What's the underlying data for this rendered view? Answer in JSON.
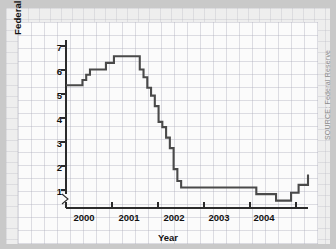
{
  "figure": {
    "source_note": "SOURCE: Federal Reserve",
    "background_color": "#c9c9c9",
    "panel_color": "#fbfbfb",
    "line_color": "#4a4a4a"
  },
  "chart_data": {
    "type": "line",
    "title": "",
    "xlabel": "Year",
    "ylabel": "Federal Funds Rate (%)",
    "xlim": [
      1999.45,
      2004.6
    ],
    "ylim": [
      0.72,
      7.35
    ],
    "grid": true,
    "legend": null,
    "y_axis_break": true,
    "line_style": "step-post",
    "xtick_labels": [
      "2000",
      "2001",
      "2002",
      "2003",
      "2004"
    ],
    "xtick_label_positions": [
      2000.0,
      2001.0,
      2002.0,
      2003.0,
      2004.0
    ],
    "xtick_mark_positions": [
      1999.5,
      2000.5,
      2001.5,
      2002.5,
      2003.5,
      2004.5
    ],
    "ytick_labels": [
      "1",
      "2",
      "3",
      "4",
      "5",
      "6",
      "7"
    ],
    "ytick_values": [
      1,
      2,
      3,
      4,
      5,
      6,
      7
    ],
    "x": [
      1999.45,
      1999.72,
      1999.8,
      1999.88,
      1999.96,
      2000.13,
      2000.3,
      2000.47,
      2000.96,
      2001.02,
      2001.1,
      2001.18,
      2001.26,
      2001.34,
      2001.42,
      2001.5,
      2001.58,
      2001.66,
      2001.74,
      2001.82,
      2001.9,
      2002.5,
      2003.5,
      2003.92,
      2004.08,
      2004.24,
      2004.4,
      2004.6
    ],
    "values": [
      5.4,
      5.4,
      5.6,
      5.8,
      6.0,
      6.0,
      6.25,
      6.5,
      6.5,
      6.0,
      5.7,
      5.3,
      5.0,
      4.6,
      4.0,
      3.8,
      3.4,
      3.0,
      2.2,
      1.75,
      1.5,
      1.5,
      1.25,
      1.0,
      1.0,
      1.3,
      1.6,
      2.0
    ],
    "series_name": "Federal Funds Rate",
    "units": "percent"
  }
}
